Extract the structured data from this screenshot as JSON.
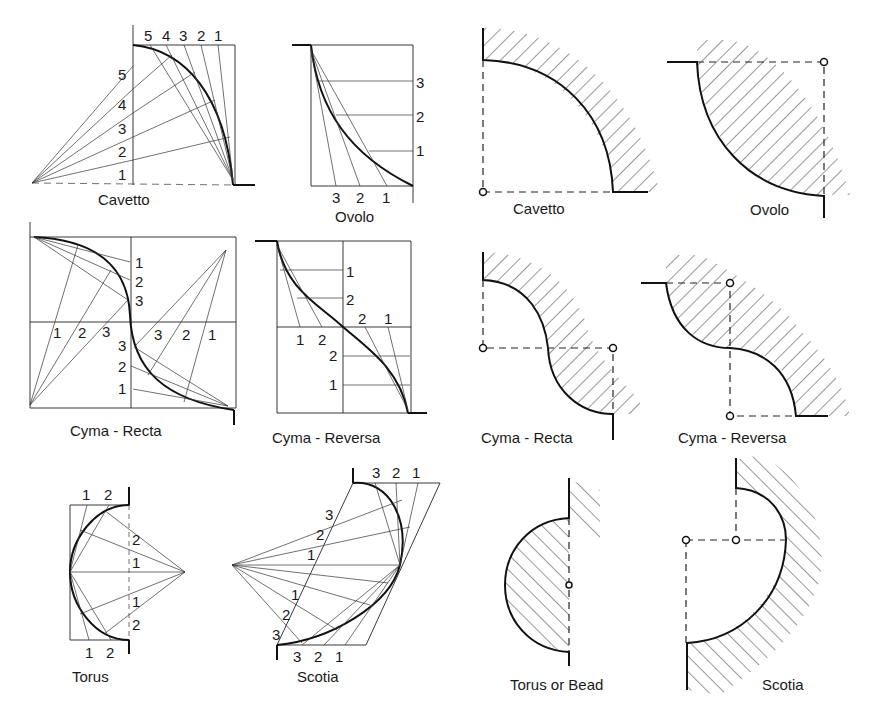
{
  "construction_drawings": {
    "cavetto": {
      "label": "Cavetto",
      "top_divisions": [
        "5",
        "4",
        "3",
        "2",
        "1"
      ],
      "side_divisions": [
        "5",
        "4",
        "3",
        "2",
        "1"
      ]
    },
    "ovolo": {
      "label": "Ovolo",
      "side_divisions": [
        "3",
        "2",
        "1"
      ],
      "bottom_divisions": [
        "3",
        "2",
        "1"
      ]
    },
    "cyma_recta": {
      "label": "Cyma - Recta",
      "upper_divisions": [
        "1",
        "2",
        "3"
      ],
      "mid_left": [
        "1",
        "2",
        "3"
      ],
      "mid_right": [
        "3",
        "2",
        "1"
      ],
      "lower_divisions": [
        "3",
        "2",
        "1"
      ]
    },
    "cyma_reversa": {
      "label": "Cyma - Reversa",
      "upper_divisions": [
        "1",
        "2"
      ],
      "mid_right": [
        "2",
        "1"
      ],
      "mid_left": [
        "1",
        "2"
      ],
      "lower_divisions": [
        "2",
        "1"
      ]
    },
    "torus": {
      "label": "Torus",
      "top_divisions": [
        "1",
        "2"
      ],
      "side_divisions": [
        "2",
        "1",
        "1",
        "2"
      ],
      "bottom_divisions": [
        "1",
        "2"
      ]
    },
    "scotia": {
      "label": "Scotia",
      "top_divisions": [
        "3",
        "2",
        "1"
      ],
      "diagonal_upper": [
        "3",
        "2",
        "1"
      ],
      "diagonal_lower": [
        "1",
        "2",
        "3"
      ],
      "bottom_divisions": [
        "3",
        "2",
        "1"
      ]
    }
  },
  "finished_profiles": {
    "cavetto": {
      "label": "Cavetto"
    },
    "ovolo": {
      "label": "Ovolo"
    },
    "cyma_recta": {
      "label": "Cyma - Recta"
    },
    "cyma_reversa": {
      "label": "Cyma - Reversa"
    },
    "torus": {
      "label": "Torus or Bead"
    },
    "scotia": {
      "label": "Scotia"
    }
  }
}
